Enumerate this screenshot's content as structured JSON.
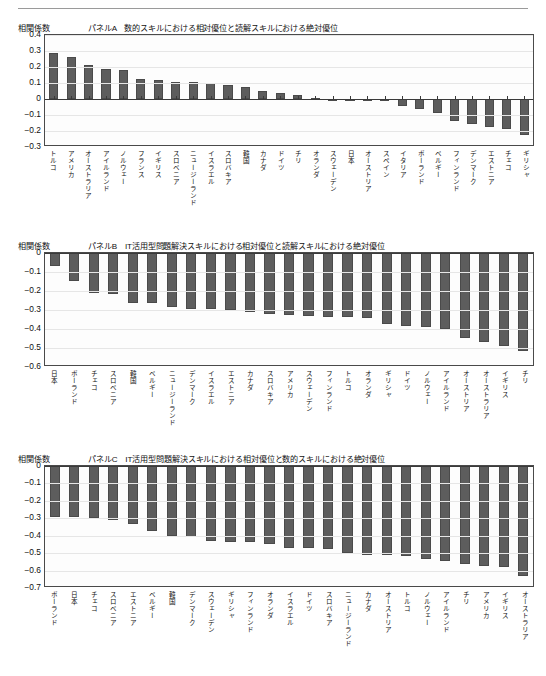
{
  "figure": {
    "y_axis_title": "相関係数",
    "bar_color": "#5d5d5d"
  },
  "chart_data": [
    {
      "type": "bar",
      "panel_id": "A",
      "title": "パネルA　数的スキルにおける相対優位と読解スキルにおける絶対優位",
      "ylabel": "相関係数",
      "xlabel": "",
      "ylim": [
        -0.3,
        0.4
      ],
      "yticks": [
        0.4,
        0.3,
        0.2,
        0.1,
        0,
        -0.1,
        -0.2,
        -0.3
      ],
      "ytick_labels": [
        "0.4",
        "0.3",
        "0.2",
        "0.1",
        "0",
        "-0.1",
        "-0.2",
        "-0.3"
      ],
      "grid": true,
      "legend": "none",
      "categories": [
        "トルコ",
        "アメリカ",
        "オーストラリア",
        "アイルランド",
        "ノルウェー",
        "フランス",
        "イギリス",
        "スロベニア",
        "ニュージーランド",
        "イスラエル",
        "スロバキア",
        "韓国",
        "カナダ",
        "ドイツ",
        "チリ",
        "オランダ",
        "スウェーデン",
        "日本",
        "オーストリア",
        "スペイン",
        "イタリア",
        "ポーランド",
        "ベルギー",
        "フィンランド",
        "デンマーク",
        "エストニア",
        "チェコ",
        "ギリシャ"
      ],
      "values": [
        0.29,
        0.26,
        0.215,
        0.185,
        0.18,
        0.125,
        0.118,
        0.108,
        0.105,
        0.098,
        0.09,
        0.075,
        0.048,
        0.035,
        0.025,
        0.004,
        0.002,
        -0.005,
        -0.012,
        -0.015,
        -0.045,
        -0.065,
        -0.09,
        -0.135,
        -0.155,
        -0.175,
        -0.19,
        -0.225
      ]
    },
    {
      "type": "bar",
      "panel_id": "B",
      "title": "パネルB　IT活用型問題解決スキルにおける相対優位と読解スキルにおける絶対優位",
      "ylabel": "相関係数",
      "xlabel": "",
      "ylim": [
        -0.6,
        0
      ],
      "yticks": [
        0,
        -0.1,
        -0.2,
        -0.3,
        -0.4,
        -0.5,
        -0.6
      ],
      "ytick_labels": [
        "0",
        "-0.1",
        "-0.2",
        "-0.3",
        "-0.4",
        "-0.5",
        "-0.6"
      ],
      "grid": true,
      "legend": "none",
      "categories": [
        "日本",
        "ポーランド",
        "チェコ",
        "スロベニア",
        "韓国",
        "ベルギー",
        "ニュージーランド",
        "デンマーク",
        "イスラエル",
        "エストニア",
        "カナダ",
        "スロバキア",
        "アメリカ",
        "スウェーデン",
        "フィンランド",
        "トルコ",
        "オランダ",
        "ギリシャ",
        "ドイツ",
        "ノルウェー",
        "アイルランド",
        "オーストリア",
        "オーストラリア",
        "イギリス",
        "チリ"
      ],
      "values": [
        -0.068,
        -0.148,
        -0.212,
        -0.216,
        -0.262,
        -0.263,
        -0.285,
        -0.295,
        -0.295,
        -0.3,
        -0.312,
        -0.322,
        -0.328,
        -0.33,
        -0.335,
        -0.338,
        -0.34,
        -0.375,
        -0.385,
        -0.392,
        -0.4,
        -0.445,
        -0.468,
        -0.492,
        -0.515
      ]
    },
    {
      "type": "bar",
      "panel_id": "C",
      "title": "パネルC　IT活用型問題解決スキルにおける相対優位と数的スキルにおける絶対優位",
      "ylabel": "相関係数",
      "xlabel": "",
      "ylim": [
        -0.7,
        0
      ],
      "yticks": [
        0,
        -0.1,
        -0.2,
        -0.3,
        -0.4,
        -0.5,
        -0.6,
        -0.7
      ],
      "ytick_labels": [
        "0",
        "-0.1",
        "-0.2",
        "-0.3",
        "-0.4",
        "-0.5",
        "-0.6",
        "-0.7"
      ],
      "grid": true,
      "legend": "none",
      "categories": [
        "ポーランド",
        "日本",
        "チェコ",
        "スロベニア",
        "エストニア",
        "ベルギー",
        "韓国",
        "デンマーク",
        "スウェーデン",
        "ギリシャ",
        "フィンランド",
        "オランダ",
        "イスラエル",
        "ドイツ",
        "スロバキア",
        "ニュージーランド",
        "カナダ",
        "オーストリア",
        "トルコ",
        "ノルウェー",
        "アイルランド",
        "チリ",
        "アメリカ",
        "イギリス",
        "オーストラリア"
      ],
      "values": [
        -0.295,
        -0.295,
        -0.298,
        -0.308,
        -0.33,
        -0.372,
        -0.402,
        -0.408,
        -0.432,
        -0.438,
        -0.438,
        -0.445,
        -0.47,
        -0.472,
        -0.478,
        -0.5,
        -0.508,
        -0.512,
        -0.518,
        -0.535,
        -0.545,
        -0.565,
        -0.575,
        -0.582,
        -0.632
      ]
    }
  ]
}
